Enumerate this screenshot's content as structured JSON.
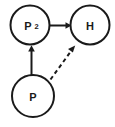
{
  "diagram": {
    "background_color": "#ffffff",
    "stroke_color": "#1a1a1a",
    "width": 115,
    "height": 127,
    "nodes": [
      {
        "id": "p2",
        "label": "P",
        "subscript": "2",
        "full_label": "P2",
        "cx": 30,
        "cy": 25,
        "r": 19.5
      },
      {
        "id": "h",
        "label": "H",
        "subscript": "",
        "full_label": "H",
        "cx": 90,
        "cy": 25,
        "r": 19.5
      },
      {
        "id": "p",
        "label": "P",
        "subscript": "",
        "full_label": "P",
        "cx": 33,
        "cy": 96,
        "r": 21
      }
    ],
    "edges": [
      {
        "id": "p2-to-h",
        "from": "p2",
        "to": "h",
        "style": "solid",
        "label": "",
        "arrow": "single"
      },
      {
        "id": "p-to-p2",
        "from": "p",
        "to": "p2",
        "style": "solid",
        "label": "",
        "arrow": "single"
      },
      {
        "id": "p-to-h",
        "from": "p",
        "to": "h",
        "style": "dashed",
        "label": "",
        "arrow": "single"
      }
    ]
  }
}
